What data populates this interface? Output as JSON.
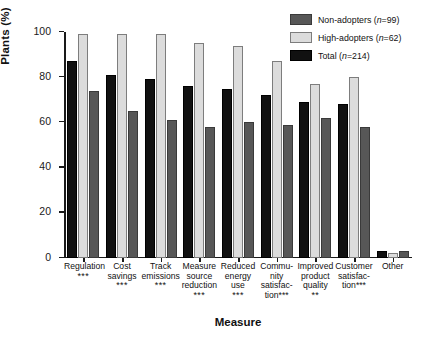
{
  "chart_data": {
    "type": "bar",
    "title": "",
    "xlabel": "Measure",
    "ylabel": "Plants (%)",
    "ylim": [
      0,
      100
    ],
    "yticks": [
      0,
      20,
      40,
      60,
      80,
      100
    ],
    "grid": false,
    "legend_position": "top-right",
    "categories": [
      "Regulation",
      "Cost savings",
      "Track emissions",
      "Measure source reduction",
      "Reduced energy use",
      "Community satisfaction",
      "Improved product quality",
      "Customer satisfaction",
      "Other"
    ],
    "category_lines": [
      [
        "Regulation"
      ],
      [
        "Cost",
        "savings"
      ],
      [
        "Track",
        "emissions"
      ],
      [
        "Measure",
        "source",
        "reduction"
      ],
      [
        "Reduced",
        "energy",
        "use"
      ],
      [
        "Commu-",
        "nity",
        "satisfac-",
        "tion"
      ],
      [
        "Improved",
        "product",
        "quality"
      ],
      [
        "Customer",
        "satisfac-",
        "tion"
      ],
      [
        "Other"
      ]
    ],
    "significance": [
      "***",
      "***",
      "***",
      "***",
      "***",
      "***",
      "**",
      "***",
      ""
    ],
    "significance_inline": [
      false,
      false,
      false,
      false,
      false,
      true,
      false,
      true,
      false
    ],
    "series": [
      {
        "name": "Total (n=214)",
        "key": "total",
        "color": "#111111",
        "values": [
          87,
          81,
          79,
          76,
          75,
          72,
          69,
          68,
          3
        ]
      },
      {
        "name": "High-adopters (n=62)",
        "key": "high",
        "color": "#dcdcdc",
        "values": [
          99,
          99,
          99,
          95,
          94,
          87,
          77,
          80,
          2
        ]
      },
      {
        "name": "Non-adopters (n=99)",
        "key": "non",
        "color": "#575757",
        "values": [
          74,
          65,
          61,
          58,
          60,
          59,
          62,
          58,
          3
        ]
      }
    ],
    "bar_order": [
      "total",
      "high",
      "non"
    ]
  },
  "legend": {
    "items": [
      {
        "label_main": "Non-adopters",
        "label_n": "(n=99)",
        "swatch": "non"
      },
      {
        "label_main": "High-adopters",
        "label_n": "(n=62)",
        "swatch": "high"
      },
      {
        "label_main": "Total",
        "label_n": "(n=214)",
        "swatch": "total"
      }
    ]
  }
}
